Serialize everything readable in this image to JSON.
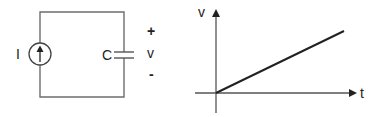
{
  "circuit": {
    "source_label": "I",
    "capacitor_label": "C",
    "voltage_plus": "+",
    "voltage_label": "v",
    "voltage_minus": "-",
    "source_type": "current-source-arrow-up"
  },
  "graph": {
    "y_axis_label": "v",
    "x_axis_label": "t",
    "curve": "linear-increasing-from-origin"
  },
  "colors": {
    "wire": "#6e6e6e",
    "graph_line": "#222222",
    "text": "#222222",
    "background": "#ffffff"
  }
}
